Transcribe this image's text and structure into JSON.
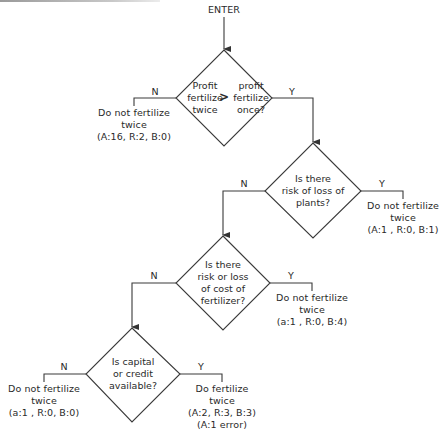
{
  "diagram": {
    "start": "ENTER",
    "decisions": [
      {
        "id": "d1",
        "left_text": "Profit\nfertilize\ntwice",
        "operator": ">",
        "right_text": "profit\nfertilize\nonce?",
        "no_label": "N",
        "yes_label": "Y"
      },
      {
        "id": "d2",
        "text": "Is there\nrisk of loss of\nplants?",
        "no_label": "N",
        "yes_label": "Y"
      },
      {
        "id": "d3",
        "text": "Is there\nrisk or loss\nof cost of\nfertilizer?",
        "no_label": "N",
        "yes_label": "Y"
      },
      {
        "id": "d4",
        "text": "Is capital\nor credit\navailable?",
        "no_label": "N",
        "yes_label": "Y"
      }
    ],
    "outcomes": [
      {
        "id": "o1",
        "from": "d1",
        "branch": "N",
        "line1": "Do not fertilize",
        "line2": "twice",
        "line3": "(A:16, R:2, B:0)"
      },
      {
        "id": "o2",
        "from": "d2",
        "branch": "Y",
        "line1": "Do not fertilize",
        "line2": "twice",
        "line3": "(A:1 , R:0, B:1)"
      },
      {
        "id": "o3",
        "from": "d3",
        "branch": "Y",
        "line1": "Do not fertilize",
        "line2": "twice",
        "line3": "(a:1 , R:0, B:4)"
      },
      {
        "id": "o4",
        "from": "d4",
        "branch": "N",
        "line1": "Do not fertilize",
        "line2": "twice",
        "line3": "(a:1 , R:0, B:0)"
      },
      {
        "id": "o5",
        "from": "d4",
        "branch": "Y",
        "line1": "Do fertilize",
        "line2": "twice",
        "line3": "(A:2, R:3, B:3)",
        "line4": "(A:1 error)"
      }
    ],
    "colors": {
      "line": "#3a3a3a",
      "text": "#2a2a2a",
      "background": "#ffffff"
    }
  }
}
